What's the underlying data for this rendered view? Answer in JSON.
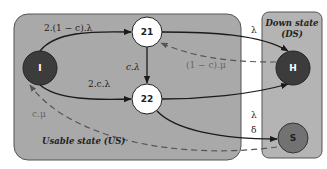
{
  "diagram": {
    "regions": {
      "usable": {
        "label": "Usable state (US)",
        "fill": "#a9a9a9"
      },
      "down": {
        "label_line1": "Down state",
        "label_line2": "(DS)",
        "fill": "#b4b4b4"
      }
    },
    "nodes": {
      "I": {
        "label": "I",
        "fill": "#3c3c3c",
        "text_color": "#ffffff"
      },
      "n21": {
        "label": "21",
        "fill": "#ffffff",
        "text_color": "#222222"
      },
      "n22": {
        "label": "22",
        "fill": "#ffffff",
        "text_color": "#222222"
      },
      "H": {
        "label": "H",
        "fill": "#3c3c3c",
        "text_color": "#ffffff"
      },
      "S": {
        "label": "S",
        "fill": "#727272",
        "text_color": "#222222"
      }
    },
    "edges": {
      "I_to_21": "2.(1 − c).λ",
      "I_to_22": "2.c.λ",
      "21_to_22": "c.λ",
      "21_to_H": "λ",
      "H_to_21": "(1 − c).μ",
      "22_to_H": "λ",
      "22_to_S": "δ",
      "S_to_I": "c.μ"
    }
  }
}
